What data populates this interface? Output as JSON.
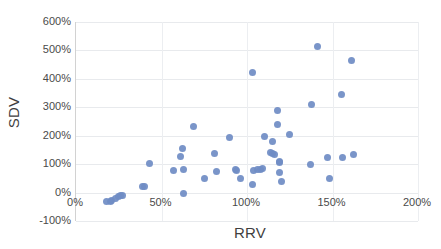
{
  "chart_data": {
    "type": "scatter",
    "title": "",
    "xlabel": "RRV",
    "ylabel": "SDV",
    "xlim": [
      0,
      200
    ],
    "ylim": [
      -100,
      600
    ],
    "x_tick_labels": [
      "0%",
      "50%",
      "100%",
      "150%",
      "200%"
    ],
    "x_ticks": [
      0,
      50,
      100,
      150,
      200
    ],
    "y_tick_labels": [
      "600%",
      "500%",
      "400%",
      "300%",
      "200%",
      "100%",
      "0%",
      "-100%"
    ],
    "y_ticks": [
      600,
      500,
      400,
      300,
      200,
      100,
      0,
      -100
    ],
    "grid": true,
    "legend": "none",
    "marker_color": "#6f8cc4",
    "units": "percent",
    "series": [
      {
        "name": "SDV vs RRV",
        "points": [
          [
            18,
            -32
          ],
          [
            20,
            -30
          ],
          [
            21,
            -28
          ],
          [
            23,
            -22
          ],
          [
            25,
            -14
          ],
          [
            26,
            -12
          ],
          [
            27,
            -11
          ],
          [
            39,
            20
          ],
          [
            40,
            22
          ],
          [
            43,
            101
          ],
          [
            57,
            76
          ],
          [
            61,
            127
          ],
          [
            62,
            156
          ],
          [
            63,
            82
          ],
          [
            63,
            -3
          ],
          [
            69,
            233
          ],
          [
            75,
            49
          ],
          [
            81,
            139
          ],
          [
            82,
            74
          ],
          [
            90,
            193
          ],
          [
            93,
            82
          ],
          [
            94,
            79
          ],
          [
            96,
            50
          ],
          [
            103,
            422
          ],
          [
            103,
            27
          ],
          [
            104,
            79
          ],
          [
            106,
            80
          ],
          [
            108,
            82
          ],
          [
            109,
            83
          ],
          [
            110,
            197
          ],
          [
            114,
            140
          ],
          [
            115,
            136
          ],
          [
            115,
            179
          ],
          [
            116,
            133
          ],
          [
            118,
            287
          ],
          [
            118,
            239
          ],
          [
            119,
            108
          ],
          [
            119,
            106
          ],
          [
            119,
            69
          ],
          [
            120,
            39
          ],
          [
            125,
            204
          ],
          [
            137,
            98
          ],
          [
            138,
            311
          ],
          [
            141,
            515
          ],
          [
            147,
            124
          ],
          [
            148,
            49
          ],
          [
            155,
            344
          ],
          [
            156,
            122
          ],
          [
            161,
            465
          ],
          [
            162,
            134
          ]
        ]
      }
    ]
  },
  "axes": {
    "x_title": "RRV",
    "y_title": "SDV"
  }
}
